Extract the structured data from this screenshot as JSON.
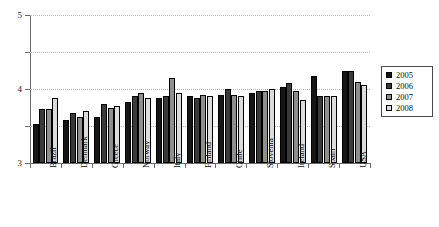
{
  "chart_data": {
    "type": "bar",
    "title": "",
    "subtitle": "",
    "xlabel": "",
    "ylabel": "",
    "ylim": [
      1,
      5
    ],
    "yticks": [
      1,
      2,
      3,
      4,
      5
    ],
    "ytick_labels": [
      "1",
      "2",
      "3",
      "4",
      "5"
    ],
    "grid": "horizontal-dotted",
    "legend_position": "right",
    "categories": [
      "Brazil",
      "Denmark",
      "Greece",
      "Norway",
      "Italy",
      "Finland",
      "Chile",
      "Slovenia",
      "Ireland",
      "Spain",
      "USA"
    ],
    "series": [
      {
        "name": "2005",
        "color": "#151515",
        "values": [
          2.05,
          2.15,
          2.25,
          2.65,
          2.75,
          2.8,
          2.85,
          2.9,
          3.05,
          3.35,
          3.5
        ]
      },
      {
        "name": "2006",
        "color": "#3a3a3a",
        "values": [
          2.45,
          2.35,
          2.6,
          2.8,
          2.8,
          2.75,
          3.0,
          2.95,
          3.15,
          2.8,
          3.5
        ]
      },
      {
        "name": "2007",
        "color": "#8f8f8f",
        "values": [
          2.45,
          2.25,
          2.5,
          2.9,
          3.3,
          2.85,
          2.85,
          2.95,
          2.95,
          2.8,
          3.2
        ]
      },
      {
        "name": "2008",
        "color": "#dcdcdc",
        "values": [
          2.75,
          2.4,
          2.55,
          2.75,
          2.9,
          2.8,
          2.8,
          3.0,
          2.7,
          2.8,
          3.1
        ]
      }
    ],
    "legend_entries": [
      "2005",
      "2006",
      "2007",
      "2008"
    ]
  }
}
